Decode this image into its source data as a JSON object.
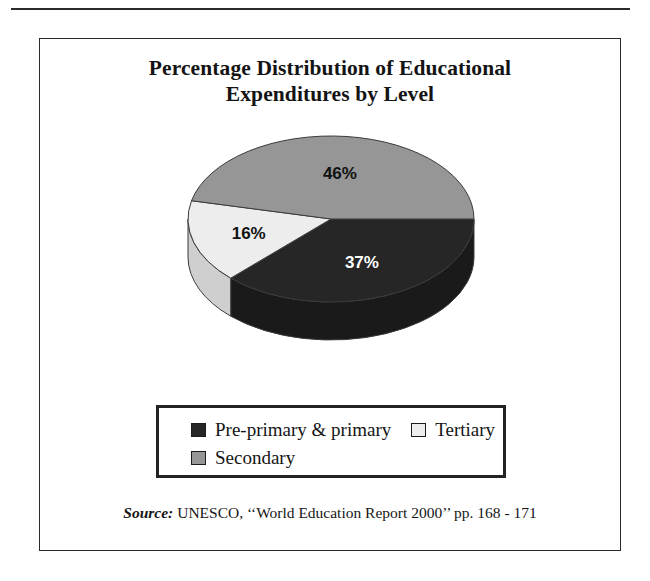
{
  "figure": {
    "title_line1": "Percentage Distribution of Educational",
    "title_line2": "Expenditures by Level"
  },
  "source": {
    "label": "Source:",
    "text": "UNESCO, ‘‘World Education Report 2000’’ pp. 168 - 171"
  },
  "legend": {
    "entries": [
      {
        "label": "Pre-primary & primary",
        "color": "#262626"
      },
      {
        "label": "Tertiary",
        "color": "#ededed"
      },
      {
        "label": "Secondary",
        "color": "#969696"
      }
    ]
  },
  "chart_data": {
    "type": "pie",
    "title": "Percentage Distribution of Educational Expenditures by Level",
    "xlabel": "",
    "ylabel": "",
    "three_d": true,
    "start_angle_deg": 0,
    "direction": "clockwise",
    "legend_position": "bottom",
    "grid": false,
    "categories": [
      "Pre-primary & primary",
      "Tertiary",
      "Secondary"
    ],
    "values": [
      37,
      16,
      46
    ],
    "labels": [
      "37%",
      "16%",
      "46%"
    ],
    "colors": [
      "#262626",
      "#ededed",
      "#969696"
    ],
    "side_colors": [
      "#1a1a1a",
      "#cfcfcf",
      "#828282"
    ],
    "label_colors": [
      "#ffffff",
      "#111111",
      "#111111"
    ],
    "units": "percent",
    "total": 99
  }
}
